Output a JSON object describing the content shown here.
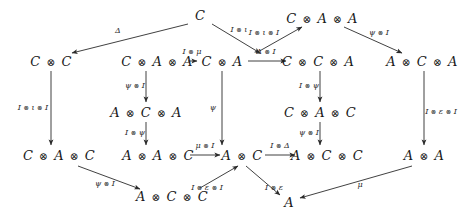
{
  "diagram": {
    "kind": "commutative-diagram",
    "background_color": "#ffffff",
    "ink_color": "#1a1a1a",
    "nodes": [
      {
        "id": "n-c-top",
        "label": "C",
        "x": 200,
        "y": 15
      },
      {
        "id": "n-caa-top",
        "label": "C ⊗ A ⊗ A",
        "x": 322,
        "y": 18
      },
      {
        "id": "n-cc",
        "label": "C ⊗ C",
        "x": 51,
        "y": 61
      },
      {
        "id": "n-caa-mid",
        "label": "C ⊗ A ⊗ A",
        "x": 157,
        "y": 61
      },
      {
        "id": "n-ca",
        "label": "C ⊗ A",
        "x": 222,
        "y": 61
      },
      {
        "id": "n-cca",
        "label": "C ⊗ C ⊗ A",
        "x": 318,
        "y": 61
      },
      {
        "id": "n-aca-right",
        "label": "A ⊗ C ⊗ A",
        "x": 422,
        "y": 61
      },
      {
        "id": "n-aca-mid",
        "label": "A ⊗ C ⊗ A",
        "x": 146,
        "y": 112
      },
      {
        "id": "n-cac",
        "label": "C ⊗ A ⊗ C",
        "x": 320,
        "y": 112
      },
      {
        "id": "n-cac-left",
        "label": "C ⊗ A ⊗ C",
        "x": 59,
        "y": 155
      },
      {
        "id": "n-aac",
        "label": "A ⊗ A ⊗ C",
        "x": 158,
        "y": 155
      },
      {
        "id": "n-ac",
        "label": "A ⊗ C",
        "x": 242,
        "y": 155
      },
      {
        "id": "n-acc-right",
        "label": "A ⊗ C ⊗ C",
        "x": 327,
        "y": 155
      },
      {
        "id": "n-aa",
        "label": "A ⊗ A",
        "x": 424,
        "y": 155
      },
      {
        "id": "n-acc-bot",
        "label": "A ⊗ C ⊗ C",
        "x": 172,
        "y": 196
      },
      {
        "id": "n-a-bot",
        "label": "A",
        "x": 289,
        "y": 202
      }
    ],
    "edges": [
      {
        "id": "e-delta",
        "label": "Δ",
        "from": "n-c-top",
        "to": "n-cc",
        "x1": 188,
        "y1": 24,
        "x2": 72,
        "y2": 53,
        "label_x": 118,
        "label_y": 31
      },
      {
        "id": "e-i-iota",
        "label": "I ⊗ ι",
        "from": "n-c-top",
        "to": "n-caa-mid",
        "x1": 212,
        "y1": 24,
        "x2": 260,
        "y2": 53,
        "label_x": 239,
        "label_y": 30
      },
      {
        "id": "e-i-iota-i",
        "label": "I ⊗ ι ⊗ I",
        "from": "n-ca",
        "to": "n-caa-top",
        "x1": 256,
        "y1": 53,
        "x2": 302,
        "y2": 27,
        "label_x": 264,
        "label_y": 33
      },
      {
        "id": "e-psi-i-top",
        "label": "ψ ⊗ I",
        "from": "n-caa-top",
        "to": "n-aca-right",
        "x1": 344,
        "y1": 27,
        "x2": 402,
        "y2": 53,
        "label_x": 379,
        "label_y": 33
      },
      {
        "id": "e-i-mu",
        "label": "I ⊗ μ",
        "from": "n-caa-mid",
        "to": "n-ca",
        "x1": 188,
        "y1": 61,
        "x2": 197,
        "y2": 61,
        "label_x": 192,
        "label_y": 52
      },
      {
        "id": "e-delta-i",
        "label": "Δ ⊗ I",
        "from": "n-ca",
        "to": "n-cca",
        "x1": 248,
        "y1": 61,
        "x2": 286,
        "y2": 61,
        "label_x": 266,
        "label_y": 52
      },
      {
        "id": "e-psi-i-colA",
        "label": "ψ ⊗ I",
        "from": "n-caa-mid",
        "to": "n-aca-mid",
        "x1": 146,
        "y1": 71,
        "x2": 146,
        "y2": 102,
        "label_x": 135,
        "label_y": 86
      },
      {
        "id": "e-i-psi-colA",
        "label": "I ⊗ ψ",
        "from": "n-aca-mid",
        "to": "n-aac",
        "x1": 146,
        "y1": 122,
        "x2": 146,
        "y2": 145,
        "label_x": 135,
        "label_y": 133
      },
      {
        "id": "e-i-iota-i-left",
        "label": "I ⊗ ι ⊗ I",
        "from": "n-cc",
        "to": "n-cac-left",
        "x1": 51,
        "y1": 71,
        "x2": 51,
        "y2": 145,
        "label_x": 33,
        "label_y": 108
      },
      {
        "id": "e-psi-vert",
        "label": "ψ",
        "from": "n-ca",
        "to": "n-ac",
        "x1": 222,
        "y1": 71,
        "x2": 222,
        "y2": 145,
        "label_x": 213,
        "label_y": 108
      },
      {
        "id": "e-i-psi-colC",
        "label": "I ⊗ ψ",
        "from": "n-cca",
        "to": "n-cac",
        "x1": 320,
        "y1": 71,
        "x2": 320,
        "y2": 102,
        "label_x": 309,
        "label_y": 86
      },
      {
        "id": "e-psi-i-colC",
        "label": "ψ ⊗ I",
        "from": "n-cac",
        "to": "n-acc-right",
        "x1": 320,
        "y1": 122,
        "x2": 320,
        "y2": 145,
        "label_x": 309,
        "label_y": 133
      },
      {
        "id": "e-i-eps-i-right",
        "label": "I ⊗ ε ⊗ I",
        "from": "n-aca-right",
        "to": "n-aa",
        "x1": 424,
        "y1": 71,
        "x2": 424,
        "y2": 145,
        "label_x": 441,
        "label_y": 112
      },
      {
        "id": "e-mu-i",
        "label": "μ ⊗ I",
        "from": "n-aac",
        "to": "n-ac",
        "x1": 190,
        "y1": 155,
        "x2": 220,
        "y2": 155,
        "label_x": 205,
        "label_y": 146
      },
      {
        "id": "e-i-delta",
        "label": "I ⊗ Δ",
        "from": "n-ac",
        "to": "n-acc-right",
        "x1": 265,
        "y1": 155,
        "x2": 295,
        "y2": 155,
        "label_x": 280,
        "label_y": 146
      },
      {
        "id": "e-psi-i-bot",
        "label": "ψ ⊗ I",
        "from": "n-cac-left",
        "to": "n-acc-bot",
        "x1": 78,
        "y1": 166,
        "x2": 140,
        "y2": 189,
        "label_x": 105,
        "label_y": 184
      },
      {
        "id": "e-i-eps-i-bot",
        "label": "I ⊗ ε ⊗ I",
        "from": "n-acc-bot",
        "to": "n-ac",
        "x1": 200,
        "y1": 188,
        "x2": 238,
        "y2": 166,
        "label_x": 207,
        "label_y": 188
      },
      {
        "id": "e-i-eps",
        "label": "I ⊗ ε",
        "from": "n-ac",
        "to": "n-a-bot",
        "x1": 246,
        "y1": 166,
        "x2": 280,
        "y2": 195,
        "label_x": 274,
        "label_y": 188
      },
      {
        "id": "e-mu-bot",
        "label": "μ",
        "from": "n-aa",
        "to": "n-a-bot",
        "x1": 412,
        "y1": 166,
        "x2": 300,
        "y2": 198,
        "label_x": 360,
        "label_y": 185
      }
    ]
  }
}
